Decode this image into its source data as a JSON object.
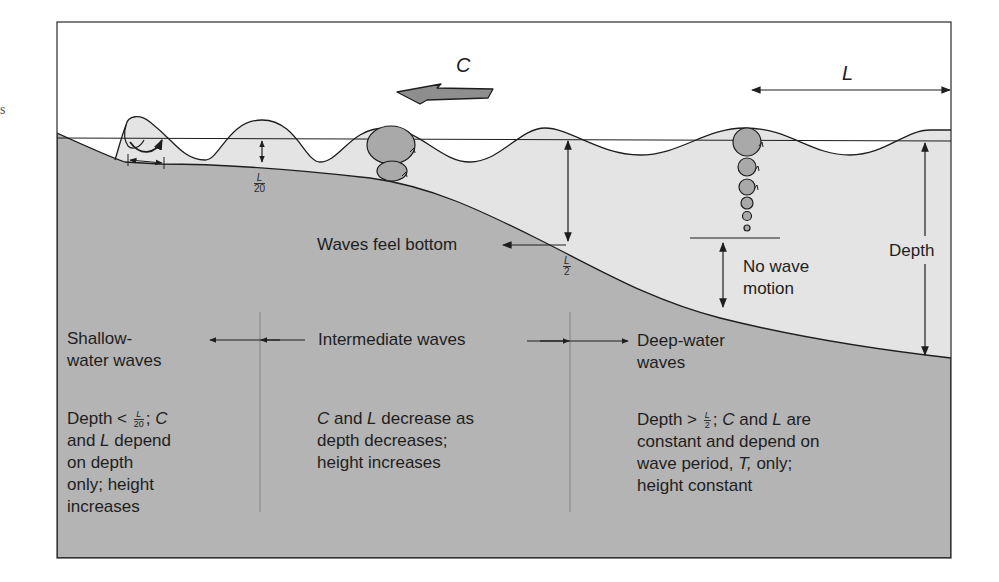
{
  "diagram": {
    "colors": {
      "air": "#ffffff",
      "water": "#e4e4e4",
      "seafloor": "#b4b4b4",
      "orbit_fill": "#a9a9a9",
      "arrow_fill": "#8e8e8e",
      "line": "#1e1e1e"
    },
    "symbols": {
      "wave_speed": "C",
      "wavelength": "L"
    },
    "annotations": {
      "shallow_depth_frac": {
        "num": "L",
        "den": "20"
      },
      "wave_base_frac": {
        "num": "L",
        "den": "2"
      },
      "waves_feel_bottom": "Waves feel bottom",
      "no_wave_motion_line1": "No wave",
      "no_wave_motion_line2": "motion",
      "depth": "Depth"
    },
    "zones": [
      {
        "id": "shallow",
        "heading_line1": "Shallow-",
        "heading_line2": "water waves",
        "desc_prefix": "Depth < ",
        "desc_frac": {
          "num": "L",
          "den": "20"
        },
        "desc_after_frac": "; ",
        "desc_line1_italic": "C",
        "desc_line2_pre": "and ",
        "desc_line2_italic": "L",
        "desc_line2_post": " depend",
        "desc_line3": "on depth",
        "desc_line4": "only; height",
        "desc_line5": "increases"
      },
      {
        "id": "intermediate",
        "heading": "Intermediate waves",
        "desc_line1_italic_a": "C",
        "desc_line1_mid": " and ",
        "desc_line1_italic_b": "L",
        "desc_line1_post": " decrease as",
        "desc_line2": "depth decreases;",
        "desc_line3": "height increases"
      },
      {
        "id": "deep",
        "heading_line1": "Deep-water",
        "heading_line2": "waves",
        "desc_prefix": "Depth > ",
        "desc_frac": {
          "num": "L",
          "den": "2"
        },
        "desc_after_frac": "; ",
        "desc_line1_italic_a": "C",
        "desc_line1_mid": " and ",
        "desc_line1_italic_b": "L",
        "desc_line1_post": " are",
        "desc_line2": "constant and depend on",
        "desc_line3_pre": "wave period, ",
        "desc_line3_italic": "T,",
        "desc_line3_post": " only;",
        "desc_line4": "height constant"
      }
    ],
    "stray_glyph": "s"
  }
}
